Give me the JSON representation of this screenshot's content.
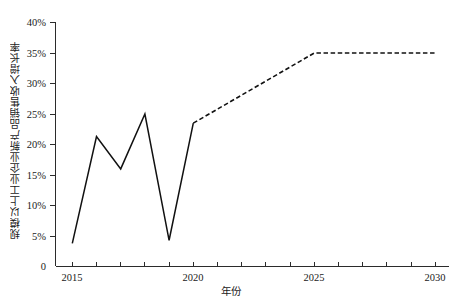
{
  "chart_data": {
    "type": "line",
    "title": "",
    "xlabel": "年份",
    "ylabel": "规模以上工业企业新产品销售收入增长率",
    "xlim": [
      2015,
      2030
    ],
    "ylim": [
      0,
      40
    ],
    "grid": false,
    "legend": null,
    "y_tick_labels": [
      "0",
      "5%",
      "10%",
      "15%",
      "20%",
      "25%",
      "30%",
      "35%",
      "40%"
    ],
    "y_tick_values": [
      0,
      5,
      10,
      15,
      20,
      25,
      30,
      35,
      40
    ],
    "x_tick_labels": [
      "2015",
      "2020",
      "2025",
      "2030"
    ],
    "x_tick_values": [
      2015,
      2020,
      2025,
      2030
    ],
    "x_minor_ticks": [
      2016,
      2017,
      2018,
      2019,
      2021,
      2022,
      2023,
      2024,
      2026,
      2027,
      2028,
      2029
    ],
    "series": [
      {
        "name": "历史值",
        "style": "solid",
        "color": "#111111",
        "x": [
          2015,
          2016,
          2017,
          2018,
          2019,
          2020
        ],
        "values": [
          3.8,
          21.3,
          16.0,
          25.0,
          4.3,
          23.5
        ]
      },
      {
        "name": "预测值",
        "style": "dashed",
        "color": "#111111",
        "x": [
          2020,
          2025,
          2030
        ],
        "values": [
          23.5,
          35.0,
          35.0
        ]
      }
    ]
  },
  "axis": {
    "y_title": "规模以上工业企业新产品销售收入增长率",
    "x_title": "年份"
  },
  "ylabels": {
    "t0": "0",
    "t5": "5%",
    "t10": "10%",
    "t15": "15%",
    "t20": "20%",
    "t25": "25%",
    "t30": "30%",
    "t35": "35%",
    "t40": "40%"
  },
  "xlabels": {
    "t2015": "2015",
    "t2020": "2020",
    "t2025": "2025",
    "t2030": "2030"
  }
}
